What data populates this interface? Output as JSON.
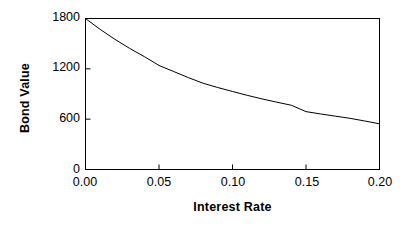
{
  "chart_data": {
    "type": "line",
    "title": "",
    "xlabel": "Interest Rate",
    "ylabel": "Bond Value",
    "xlim": [
      0.0,
      0.2
    ],
    "ylim": [
      0,
      1800
    ],
    "xticks": [
      "0.00",
      "0.05",
      "0.10",
      "0.15",
      "0.20"
    ],
    "xtick_values": [
      0.0,
      0.05,
      0.1,
      0.15,
      0.2
    ],
    "yticks": [
      "0",
      "600",
      "1200",
      "1800"
    ],
    "ytick_values": [
      0,
      600,
      1200,
      1800
    ],
    "grid": false,
    "legend": null,
    "series": [
      {
        "name": "Bond Value",
        "color": "#000000",
        "x": [
          0.0,
          0.01,
          0.02,
          0.03,
          0.04,
          0.05,
          0.06,
          0.07,
          0.08,
          0.09,
          0.1,
          0.11,
          0.12,
          0.13,
          0.14,
          0.15,
          0.16,
          0.17,
          0.18,
          0.19,
          0.2
        ],
        "values": [
          1800,
          1670,
          1552,
          1444,
          1346,
          1240,
          1168,
          1095,
          1028,
          977,
          930,
          884,
          842,
          803,
          766,
          690,
          662,
          636,
          610,
          578,
          545
        ]
      }
    ]
  },
  "axes": {
    "frame_color": "#000000",
    "line_color": "#000000"
  }
}
